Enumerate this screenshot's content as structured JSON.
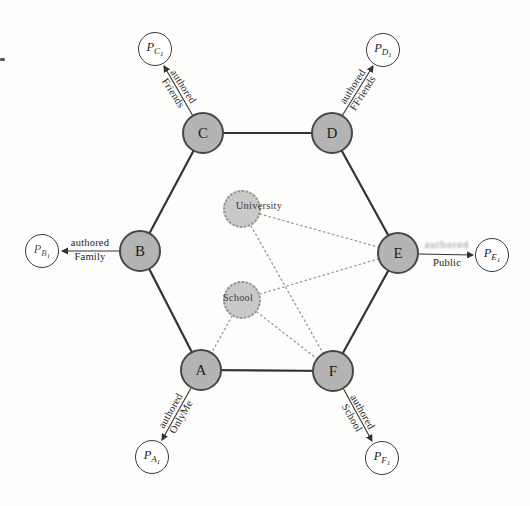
{
  "figure": {
    "background": "#fdfdfc",
    "description_visible_text_only": true
  },
  "colors": {
    "member_node_fill": "#b4b4b4",
    "member_node_border": "#474747",
    "group_node_fill": "#c9c9c9",
    "group_node_border": "#8f8f8f",
    "post_node_fill": "#ffffff",
    "post_node_border": "#3a3a3a",
    "solid_edge": "#333333",
    "dotted_edge": "#999999"
  },
  "nodes": {
    "a": {
      "label": "A"
    },
    "b": {
      "label": "B"
    },
    "c": {
      "label": "C"
    },
    "d": {
      "label": "D"
    },
    "e": {
      "label": "E"
    },
    "f": {
      "label": "F"
    }
  },
  "groups": {
    "university": {
      "label": "University"
    },
    "school": {
      "label": "School"
    }
  },
  "p_nodes": {
    "pc1": {
      "main": "P",
      "sub": "C",
      "subsub": "1"
    },
    "pd1": {
      "main": "P",
      "sub": "D",
      "subsub": "1"
    },
    "pb1": {
      "main": "P",
      "sub": "B",
      "subsub": "1"
    },
    "pe1": {
      "main": "P",
      "sub": "E",
      "subsub": "1"
    },
    "pa1": {
      "main": "P",
      "sub": "A",
      "subsub": "1"
    },
    "pf1": {
      "main": "P",
      "sub": "F",
      "subsub": "1"
    }
  },
  "edge_labels": {
    "c": {
      "line1": "authored",
      "line2": "Friends"
    },
    "d": {
      "line1": "authored",
      "line2": "FFriends"
    },
    "b": {
      "line1": "authored",
      "line2": "Family"
    },
    "e": {
      "line1": "authored",
      "line2": "Public"
    },
    "a": {
      "line1": "authored",
      "line2": "OnlyMe"
    },
    "f": {
      "line1": "authored",
      "line2": "School"
    }
  },
  "structure": {
    "hexagon_edges": [
      [
        "A",
        "B"
      ],
      [
        "B",
        "C"
      ],
      [
        "C",
        "D"
      ],
      [
        "D",
        "E"
      ],
      [
        "E",
        "F"
      ],
      [
        "F",
        "A"
      ]
    ],
    "authored_edges": [
      [
        "C",
        "PC1"
      ],
      [
        "D",
        "PD1"
      ],
      [
        "B",
        "PB1"
      ],
      [
        "E",
        "PE1"
      ],
      [
        "A",
        "PA1"
      ],
      [
        "F",
        "PF1"
      ]
    ],
    "dotted_edges": [
      [
        "University",
        "E"
      ],
      [
        "University",
        "F"
      ],
      [
        "School",
        "A"
      ],
      [
        "School",
        "E"
      ],
      [
        "School",
        "F"
      ]
    ]
  }
}
